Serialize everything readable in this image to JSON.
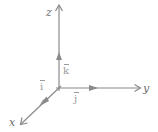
{
  "diagram": {
    "axes": [
      {
        "name": "z",
        "label": "z",
        "direction": "up"
      },
      {
        "name": "y",
        "label": "y",
        "direction": "right"
      },
      {
        "name": "x",
        "label": "x",
        "direction": "down-left"
      }
    ],
    "unit_vectors": [
      {
        "name": "i",
        "label": "i",
        "axis": "x"
      },
      {
        "name": "j",
        "label": "j",
        "axis": "y"
      },
      {
        "name": "k",
        "label": "k",
        "axis": "z"
      }
    ],
    "colors": {
      "axis": "#8a8a8a",
      "label": "#6b6b6b",
      "background": "#ffffff"
    }
  }
}
